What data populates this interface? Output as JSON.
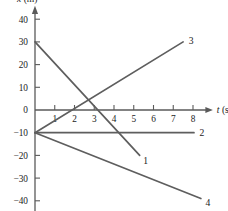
{
  "chart_data": {
    "type": "line",
    "title": "",
    "xlabel": "t (s)",
    "ylabel": "x (m)",
    "xlabel_symbol": "t",
    "xlabel_unit": "(s)",
    "ylabel_symbol": "x",
    "ylabel_unit": "(m)",
    "xlim": [
      0,
      8.6
    ],
    "ylim": [
      -44,
      45
    ],
    "grid": false,
    "legend": "inline-end-labels",
    "xticks": [
      1,
      2,
      3,
      4,
      5,
      6,
      7,
      8
    ],
    "xtick_labels": [
      "1",
      "2",
      "3",
      "4",
      "5",
      "6",
      "7",
      "8"
    ],
    "yticks": [
      40,
      30,
      20,
      10,
      0,
      -10,
      -20,
      -30,
      -40
    ],
    "ytick_labels": [
      "40",
      "30",
      "20",
      "10",
      "0",
      "−10",
      "−20",
      "−30",
      "−40"
    ],
    "series": [
      {
        "name": "1",
        "label": "1",
        "x": [
          0,
          5.3
        ],
        "y": [
          30,
          -20
        ],
        "label_x": 5.6,
        "label_y": -22.5
      },
      {
        "name": "2",
        "label": "2",
        "x": [
          0,
          8.05
        ],
        "y": [
          -10,
          -10
        ],
        "label_x": 8.45,
        "label_y": -10
      },
      {
        "name": "3",
        "label": "3",
        "x": [
          0,
          7.5
        ],
        "y": [
          -10,
          30
        ],
        "label_x": 7.9,
        "label_y": 30.5
      },
      {
        "name": "4",
        "label": "4",
        "x": [
          0,
          8.4
        ],
        "y": [
          -10,
          -39
        ],
        "label_x": 8.75,
        "label_y": -41
      }
    ]
  },
  "colors": {
    "axis": "#5a5a5a",
    "line": "#5e5e5e",
    "text": "#1a1a1a",
    "background": "#ffffff"
  }
}
